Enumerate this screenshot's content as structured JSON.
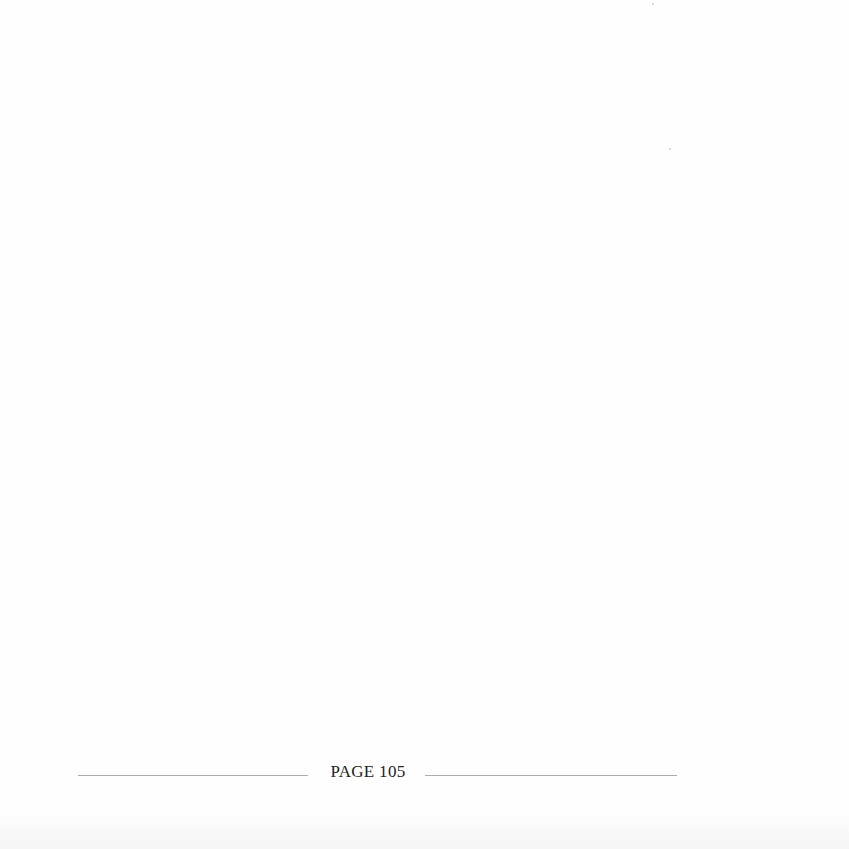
{
  "page": {
    "footer": {
      "label": "PAGE 105"
    }
  }
}
